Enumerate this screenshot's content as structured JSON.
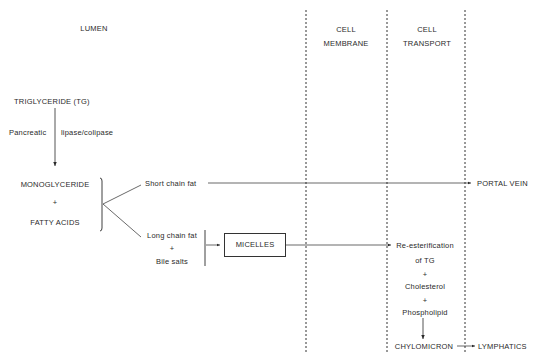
{
  "diagram": {
    "type": "flowchart",
    "columns": {
      "lumen": "LUMEN",
      "cell_membrane": [
        "CELL",
        "MEMBRANE"
      ],
      "cell_transport": [
        "CELL",
        "TRANSPORT"
      ]
    },
    "nodes": {
      "triglyceride": "TRIGLYCERIDE  (TG)",
      "enzyme_left": "Pancreatic",
      "enzyme_right": "lipase/colipase",
      "monoglyceride": "MONOGLYCERIDE",
      "plus1": "+",
      "fatty_acids": "FATTY ACIDS",
      "short_chain": "Short chain fat",
      "long_chain": "Long chain fat",
      "plus2": "+",
      "bile_salts": "Bile salts",
      "micelles": "MICELLES",
      "portal_vein": "PORTAL VEIN",
      "reesterification": "Re-esterification",
      "of_tg": "of TG",
      "plus3": "+",
      "cholesterol": "Cholesterol",
      "plus4": "+",
      "phospholipid": "Phospholipid",
      "chylomicron": "CHYLOMICRON",
      "lymphatics": "LYMPHATICS"
    },
    "edges": [
      {
        "from": "triglyceride",
        "to": "monoglyceride",
        "label": "Pancreatic lipase/colipase"
      },
      {
        "from": "monoglyceride+fatty_acids",
        "to": "short_chain"
      },
      {
        "from": "monoglyceride+fatty_acids",
        "to": "long_chain"
      },
      {
        "from": "short_chain",
        "to": "portal_vein"
      },
      {
        "from": "long_chain+bile_salts",
        "to": "micelles"
      },
      {
        "from": "micelles",
        "to": "reesterification"
      },
      {
        "from": "phospholipid",
        "to": "chylomicron"
      },
      {
        "from": "chylomicron",
        "to": "lymphatics"
      }
    ],
    "colors": {
      "ink": "#2a2a2a",
      "background": "#ffffff"
    }
  }
}
